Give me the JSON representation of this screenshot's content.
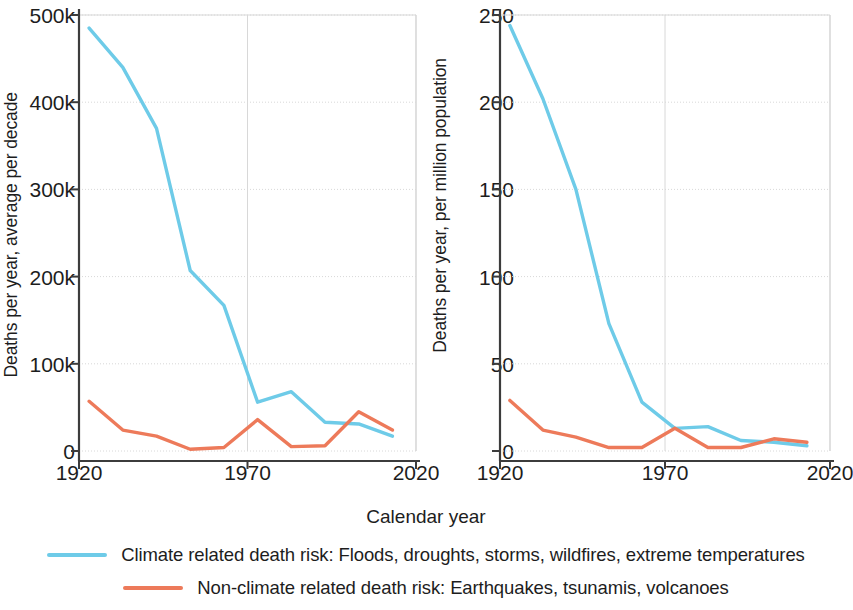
{
  "chart_data": [
    {
      "type": "line",
      "panel": "left",
      "title": "",
      "xlabel": "Calendar year",
      "ylabel": "Deaths per year, average per decade",
      "xlim": [
        1920,
        2020
      ],
      "ylim": [
        0,
        500000
      ],
      "xticks": [
        1920,
        1970,
        2020
      ],
      "xticklabels": [
        "1920",
        "1970",
        "2020"
      ],
      "yticks": [
        0,
        100000,
        200000,
        300000,
        400000,
        500000
      ],
      "yticklabels": [
        "0",
        "100k",
        "200k",
        "300k",
        "400k",
        "500k"
      ],
      "grid": true,
      "legend_position": "bottom",
      "series": [
        {
          "name": "Climate related death risk: Floods, droughts, storms, wildfires, extreme temperatures",
          "color": "#6ecbe8",
          "x": [
            1923,
            1933,
            1943,
            1953,
            1963,
            1973,
            1983,
            1993,
            2003,
            2013
          ],
          "values": [
            485000,
            440000,
            370000,
            207000,
            167000,
            56000,
            68000,
            33000,
            31000,
            17000
          ]
        },
        {
          "name": "Non-climate related death risk: Earthquakes, tsunamis, volcanoes",
          "color": "#ed7a5a",
          "x": [
            1923,
            1933,
            1943,
            1953,
            1963,
            1973,
            1983,
            1993,
            2003,
            2013
          ],
          "values": [
            57000,
            24000,
            17000,
            2000,
            4000,
            36000,
            5000,
            6000,
            45000,
            24000
          ]
        }
      ]
    },
    {
      "type": "line",
      "panel": "right",
      "title": "",
      "xlabel": "Calendar year",
      "ylabel": "Deaths per year, per million population",
      "xlim": [
        1920,
        2020
      ],
      "ylim": [
        0,
        250
      ],
      "xticks": [
        1920,
        1970,
        2020
      ],
      "xticklabels": [
        "1920",
        "1970",
        "2020"
      ],
      "yticks": [
        0,
        50,
        100,
        150,
        200,
        250
      ],
      "yticklabels": [
        "0",
        "50",
        "100",
        "150",
        "200",
        "250"
      ],
      "grid": true,
      "legend_position": "bottom",
      "series": [
        {
          "name": "Climate related death risk: Floods, droughts, storms, wildfires, extreme temperatures",
          "color": "#6ecbe8",
          "x": [
            1923,
            1933,
            1943,
            1953,
            1963,
            1973,
            1983,
            1993,
            2003,
            2013
          ],
          "values": [
            244,
            202,
            150,
            73,
            28,
            13,
            14,
            6,
            5,
            3
          ]
        },
        {
          "name": "Non-climate related death risk: Earthquakes, tsunamis, volcanoes",
          "color": "#ed7a5a",
          "x": [
            1923,
            1933,
            1943,
            1953,
            1963,
            1973,
            1983,
            1993,
            2003,
            2013
          ],
          "values": [
            29,
            12,
            8,
            2,
            2,
            13,
            2,
            2,
            7,
            5
          ]
        }
      ]
    }
  ],
  "axis": {
    "xlabel": "Calendar year"
  },
  "legend": {
    "items": [
      {
        "label": "Climate related death risk: Floods, droughts, storms, wildfires, extreme temperatures",
        "color": "#6ecbe8"
      },
      {
        "label": "Non-climate related death risk: Earthquakes, tsunamis, volcanoes",
        "color": "#ed7a5a"
      }
    ]
  },
  "colors": {
    "climate": "#6ecbe8",
    "non_climate": "#ed7a5a",
    "axis": "#3c3c3c",
    "grid": "#d8d8d8",
    "text": "#1d1d1d"
  }
}
